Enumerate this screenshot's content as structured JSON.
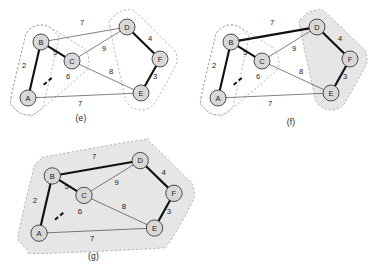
{
  "figure": {
    "nodes": [
      {
        "id": "A",
        "label": "A",
        "x": 28,
        "y": 98
      },
      {
        "id": "B",
        "label": "B",
        "x": 41,
        "y": 42
      },
      {
        "id": "C",
        "label": "C",
        "x": 72,
        "y": 61
      },
      {
        "id": "D",
        "label": "D",
        "x": 127,
        "y": 27
      },
      {
        "id": "E",
        "label": "E",
        "x": 141,
        "y": 93
      },
      {
        "id": "F",
        "label": "F",
        "x": 160,
        "y": 59
      }
    ],
    "edges": [
      {
        "id": "AB",
        "from": "A",
        "to": "B",
        "weight": "2",
        "lx": 24,
        "ly": 68,
        "style": "bold"
      },
      {
        "id": "BC",
        "from": "B",
        "to": "C",
        "weight": "5",
        "lx": 55,
        "ly": 55,
        "style": "bold"
      },
      {
        "id": "AC",
        "from": "A",
        "to": "C",
        "weight": "6",
        "lx": 68,
        "ly": 79,
        "style": "dashed"
      },
      {
        "id": "BD",
        "from": "B",
        "to": "D",
        "weight": "7",
        "lx": 82,
        "ly": 25,
        "style": "thin"
      },
      {
        "id": "CD",
        "from": "C",
        "to": "D",
        "weight": "9",
        "lx": 104,
        "ly": 51,
        "style": "thin"
      },
      {
        "id": "CE",
        "from": "C",
        "to": "E",
        "weight": "8",
        "lx": 111,
        "ly": 74,
        "style": "thin"
      },
      {
        "id": "AE",
        "from": "A",
        "to": "E",
        "weight": "7",
        "lx": 80,
        "ly": 106,
        "style": "thin"
      },
      {
        "id": "DF",
        "from": "D",
        "to": "F",
        "weight": "4",
        "lx": 150,
        "ly": 41,
        "style": "bold"
      },
      {
        "id": "EF",
        "from": "E",
        "to": "F",
        "weight": "3",
        "lx": 155,
        "ly": 79,
        "style": "bold"
      }
    ],
    "node_radius": 8,
    "colors": {
      "node_fill": "#d8d8d8",
      "node_stroke": "#3c3c3c",
      "edge_thin": "#4a4a4a",
      "edge_bold": "#101010",
      "cluster_stroke": "#9a9a9a",
      "cluster_fill": "#e6e6e6",
      "label_text": "#1a1a1a"
    }
  },
  "panels": [
    {
      "id": "e",
      "caption": "(e)",
      "bold_edges": [
        "AB",
        "BC",
        "DF",
        "EF"
      ],
      "clusters": [
        {
          "name": "cluster-ab",
          "members": [
            "A",
            "B"
          ],
          "filled": false
        },
        {
          "name": "cluster-abc",
          "members": [
            "A",
            "B",
            "C"
          ],
          "filled": false
        },
        {
          "name": "cluster-def",
          "members": [
            "D",
            "E",
            "F"
          ],
          "filled": false
        }
      ]
    },
    {
      "id": "f",
      "caption": "(f)",
      "bold_edges": [
        "AB",
        "BC",
        "BD",
        "DF",
        "EF"
      ],
      "clusters": [
        {
          "name": "cluster-ab",
          "members": [
            "A",
            "B"
          ],
          "filled": false
        },
        {
          "name": "cluster-abc",
          "members": [
            "A",
            "B",
            "C"
          ],
          "filled": false
        },
        {
          "name": "cluster-def",
          "members": [
            "D",
            "E",
            "F"
          ],
          "filled": true
        }
      ]
    },
    {
      "id": "g",
      "caption": "(g)",
      "bold_edges": [
        "AB",
        "BC",
        "BD",
        "DF",
        "EF"
      ],
      "clusters": [
        {
          "name": "cluster-all",
          "members": [
            "A",
            "B",
            "C",
            "D",
            "E",
            "F"
          ],
          "filled": true
        }
      ]
    }
  ]
}
